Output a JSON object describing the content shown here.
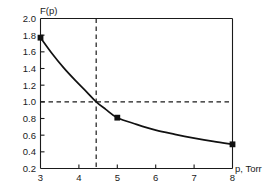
{
  "chart_data": {
    "type": "line",
    "title": "",
    "xlabel": "p, Torr",
    "ylabel": "F(p)",
    "xlim": [
      3,
      8
    ],
    "ylim": [
      0.2,
      2.0
    ],
    "grid": false,
    "legend": null,
    "x_ticks": [
      "3",
      "4",
      "5",
      "6",
      "7",
      "8"
    ],
    "x_tick_values": [
      3,
      4,
      5,
      6,
      7,
      8
    ],
    "y_ticks": [
      "2.0",
      "1.8",
      "1.6",
      "1.4",
      "1.2",
      "1.0",
      "0.8",
      "0.6",
      "0.4",
      "0.2"
    ],
    "y_tick_values": [
      2.0,
      1.8,
      1.6,
      1.4,
      1.2,
      1.0,
      0.8,
      0.6,
      0.4,
      0.2
    ],
    "series": [
      {
        "name": "F(p)",
        "marker": "filled-square",
        "x": [
          3,
          5,
          8
        ],
        "values": [
          1.77,
          0.81,
          0.49
        ]
      }
    ],
    "curve_points": [
      {
        "x": 3.0,
        "y": 1.77
      },
      {
        "x": 3.3,
        "y": 1.58
      },
      {
        "x": 3.6,
        "y": 1.41
      },
      {
        "x": 3.9,
        "y": 1.26
      },
      {
        "x": 4.2,
        "y": 1.12
      },
      {
        "x": 4.45,
        "y": 1.0
      },
      {
        "x": 4.7,
        "y": 0.91
      },
      {
        "x": 5.0,
        "y": 0.81
      },
      {
        "x": 5.5,
        "y": 0.73
      },
      {
        "x": 6.0,
        "y": 0.66
      },
      {
        "x": 6.5,
        "y": 0.61
      },
      {
        "x": 7.0,
        "y": 0.565
      },
      {
        "x": 7.5,
        "y": 0.525
      },
      {
        "x": 8.0,
        "y": 0.49
      }
    ],
    "annotations": [
      {
        "name": "horizontal-reference-line",
        "style": "dashed",
        "orientation": "horizontal",
        "value": 1.0
      },
      {
        "name": "vertical-reference-line",
        "style": "dashed",
        "orientation": "vertical",
        "value": 4.45
      }
    ],
    "intersection": {
      "x": 4.45,
      "y": 1.0
    },
    "colors": {
      "curve": "#111111",
      "marker": "#111111",
      "axis": "#1a1a1a",
      "guide": "#1a1a1a",
      "background": "#ffffff"
    }
  }
}
